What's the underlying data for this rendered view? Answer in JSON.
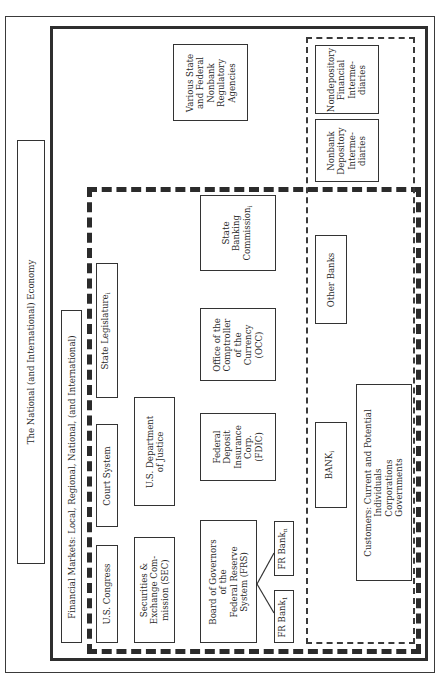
{
  "diagram": {
    "outer_frame": {
      "label": "The National (and International) Economy"
    },
    "financial_markets": {
      "label": "Financial Markets: Local, Regional, National, (and International)"
    },
    "government": {
      "state_legislature": {
        "text": "State Legislature",
        "sub": "i"
      },
      "court_system": {
        "text": "Court System"
      },
      "us_congress": {
        "text": "U.S. Congress"
      },
      "doj": {
        "lines": [
          "U.S. Department",
          "of Justice"
        ]
      },
      "sec": {
        "lines": [
          "Securities &",
          "Exchange Com-",
          "mission (SEC)"
        ]
      }
    },
    "regulators": {
      "various_state_federal": {
        "lines": [
          "Various State",
          "and Federal",
          "Nonbank",
          "Regulatory",
          "Agencies"
        ]
      },
      "state_banking_commission": {
        "lines": [
          "State",
          "Banking",
          "Commission"
        ],
        "sub": "i"
      },
      "occ": {
        "lines": [
          "Office of the",
          "Comptroller",
          "of the",
          "Currency",
          "(OCC)"
        ]
      },
      "fdic": {
        "lines": [
          "Federal",
          "Deposit",
          "Insurance",
          "Corp.",
          "(FDIC)"
        ]
      },
      "frs": {
        "lines": [
          "Board of Governors",
          "of the",
          "Federal Reserve",
          "System (FRS)"
        ]
      },
      "fr_bank_n": {
        "text": "FR Bank",
        "sub": "n"
      },
      "fr_bank_1": {
        "text": "FR Bank",
        "sub": "1"
      }
    },
    "market_participants": {
      "nondepository": {
        "lines": [
          "Nondepository",
          "Financial",
          "Interme-",
          "diaries"
        ]
      },
      "nonbank_depository": {
        "lines": [
          "Nonbank",
          "Depository",
          "Interme-",
          "diaries"
        ]
      },
      "other_banks": {
        "text": "Other Banks"
      },
      "bank_i": {
        "text": "BANK",
        "sub": "i"
      },
      "customers": {
        "lines": [
          "Customers: Current and Potential",
          "Individuals",
          "Corporations",
          "Governments"
        ]
      }
    },
    "colors": {
      "line": "#2e2e2e",
      "background": "#ffffff"
    }
  }
}
